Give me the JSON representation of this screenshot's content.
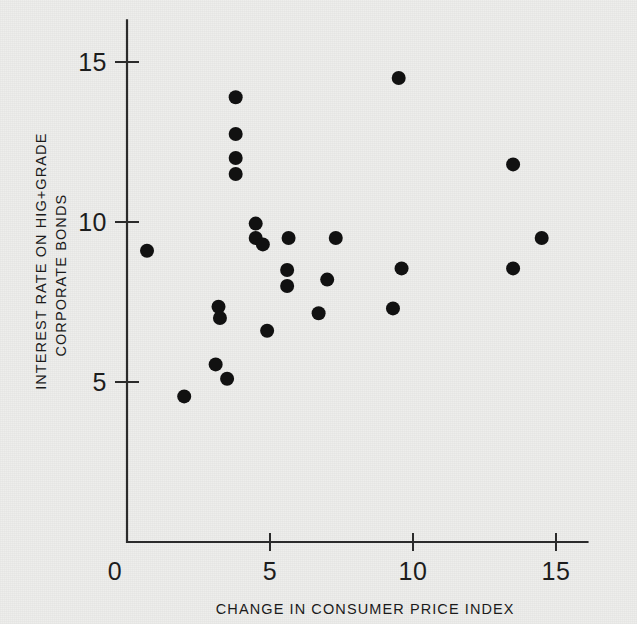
{
  "chart_data": {
    "type": "scatter",
    "title": "",
    "xlabel": "CHANGE IN CONSUMER PRICE INDEX",
    "ylabel_line1": "INTEREST RATE ON HIG+GRADE",
    "ylabel_line2": "CORPORATE BONDS",
    "xlim": [
      0,
      16.1
    ],
    "ylim": [
      0,
      16.3
    ],
    "xticks": [
      0,
      5,
      10,
      15
    ],
    "xtick_labels": [
      "0",
      "5",
      "10",
      "15"
    ],
    "yticks": [
      5,
      10,
      15
    ],
    "ytick_labels": [
      "5",
      "10",
      "15"
    ],
    "grid": false,
    "legend": null,
    "marker": "filled-circle",
    "marker_color": "#111111",
    "points": [
      {
        "x": 0.7,
        "y": 9.1
      },
      {
        "x": 2.0,
        "y": 4.55
      },
      {
        "x": 3.1,
        "y": 5.55
      },
      {
        "x": 3.2,
        "y": 7.35
      },
      {
        "x": 3.25,
        "y": 7.0
      },
      {
        "x": 3.5,
        "y": 5.1
      },
      {
        "x": 3.8,
        "y": 13.9
      },
      {
        "x": 3.8,
        "y": 12.75
      },
      {
        "x": 3.8,
        "y": 12.0
      },
      {
        "x": 3.8,
        "y": 11.5
      },
      {
        "x": 4.5,
        "y": 9.95
      },
      {
        "x": 4.5,
        "y": 9.5
      },
      {
        "x": 4.75,
        "y": 9.3
      },
      {
        "x": 4.9,
        "y": 6.6
      },
      {
        "x": 5.6,
        "y": 8.5
      },
      {
        "x": 5.65,
        "y": 9.5
      },
      {
        "x": 5.6,
        "y": 8.0
      },
      {
        "x": 6.7,
        "y": 7.15
      },
      {
        "x": 7.0,
        "y": 8.2
      },
      {
        "x": 7.3,
        "y": 9.5
      },
      {
        "x": 9.5,
        "y": 14.5
      },
      {
        "x": 9.6,
        "y": 8.55
      },
      {
        "x": 9.3,
        "y": 7.3
      },
      {
        "x": 13.5,
        "y": 11.8
      },
      {
        "x": 13.5,
        "y": 8.55
      },
      {
        "x": 14.5,
        "y": 9.5
      }
    ]
  },
  "colors": {
    "background": "#eeeeec",
    "axis": "#2b2b2b",
    "text": "#1b1b1b",
    "marker": "#111111"
  }
}
